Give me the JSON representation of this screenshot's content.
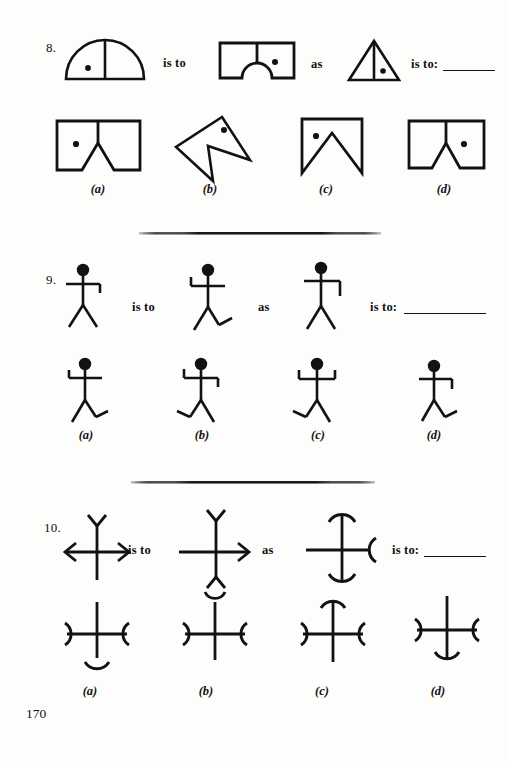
{
  "page": {
    "page_number": "170",
    "background_color": "#fdfdfc",
    "ink_color": "#121212"
  },
  "connectors": {
    "is_to": "is to",
    "as": "as",
    "is_to_colon": "is to:"
  },
  "questions": [
    {
      "number": "8.",
      "prompt_figures": [
        {
          "name": "semicircle-with-divider-dot-left",
          "description": "Half-disc (dome) on a baseline with a vertical divider at centre and a dot in the left half"
        },
        {
          "name": "rectangle-semicircular-notch-dot-right",
          "description": "Rectangle with a semicircular notch cut from the bottom centre, short vertical divider at top centre, dot in right half"
        },
        {
          "name": "triangle-with-divider-dot-right",
          "description": "Triangle with a vertical line from apex to base, dot in the right half"
        }
      ],
      "options": [
        {
          "label": "(a)",
          "name": "rect-triangular-notch-dot-left",
          "description": "Rectangle with triangular notch cut from bottom centre, dot in left half"
        },
        {
          "label": "(b)",
          "name": "rotated-arrow-polygon-dot-top",
          "description": "Tilted angular arrowhead polygon with a dot near the top vertex"
        },
        {
          "label": "(c)",
          "name": "banner-deep-triangular-notch-dot-left",
          "description": "Rectangle with a deep triangular notch (banner shape), dot in upper left"
        },
        {
          "label": "(d)",
          "name": "rect-triangular-notch-dot-right",
          "description": "Rectangle with triangular notch cut from bottom centre, dot in right half"
        }
      ]
    },
    {
      "number": "9.",
      "prompt_figures": [
        {
          "name": "stick-figure-right-arm-bent-down",
          "description": "Stick figure, straight legs, right arm bent downward at the hand"
        },
        {
          "name": "stick-figure-left-arm-bent-up-right-leg-foot",
          "description": "Stick figure, left arm bent upward, right leg bent forming a foot"
        },
        {
          "name": "stick-figure-right-arm-long-bend-down",
          "description": "Stick figure, straight legs, right arm with a long downward bend"
        }
      ],
      "options": [
        {
          "label": "(a)",
          "name": "stick-figure-left-arm-up-right-foot",
          "description": "Left arm bent up, right leg bent forming a foot"
        },
        {
          "label": "(b)",
          "name": "stick-figure-left-arm-up-right-arm-down-left-foot",
          "description": "Left arm bent up, right arm bent down, left leg bent forming a foot"
        },
        {
          "label": "(c)",
          "name": "stick-figure-both-arms-up-left-foot",
          "description": "Both arms bent upward, left leg bent forming a foot"
        },
        {
          "label": "(d)",
          "name": "stick-figure-right-arm-down-right-foot",
          "description": "Right arm bent down, right leg bent forming a foot"
        }
      ]
    },
    {
      "number": "10.",
      "prompt_figures": [
        {
          "name": "cross-fork-top-arrows-both-sides",
          "description": "Cross with a Y fork on top arm and arrowheads on left and right arms"
        },
        {
          "name": "cross-fork-top-and-bottom-arrow-right",
          "description": "Cross with Y forks top and bottom, arrowhead on right arm, plain left arm"
        },
        {
          "name": "cross-arc-caps-vertical-arc-right",
          "description": "Cross with arc caps on top and bottom arms and an arc on the right arm"
        }
      ],
      "options": [
        {
          "label": "(a)",
          "name": "cross-arcs-sides-arc-bottom",
          "description": "Cross with outward arcs on left and right arms and an arc cap on the bottom arm"
        },
        {
          "label": "(b)",
          "name": "cross-fork-top-arcs-sides",
          "description": "Cross with a Y fork on the top arm and outward arcs on left and right arms"
        },
        {
          "label": "(c)",
          "name": "cross-arc-cap-top-arcs-sides",
          "description": "Cross with an arc cap on the top arm and outward arcs on left and right arms"
        },
        {
          "label": "(d)",
          "name": "cross-arc-cap-bottom-arcs-sides",
          "description": "Cross with an arc cap on the bottom arm and outward arcs on left and right arms"
        }
      ]
    }
  ]
}
